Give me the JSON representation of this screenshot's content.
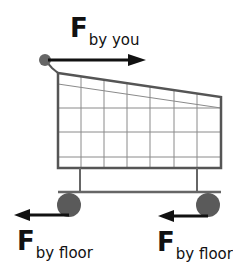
{
  "diagram": {
    "title": "",
    "colors": {
      "arrow": "#111111",
      "frame": "#555555",
      "grid": "#7a7a7a",
      "wheel": "#5a5a5a",
      "background": "#ffffff"
    },
    "labels": {
      "push": {
        "symbol": "F",
        "subscript": "by you"
      },
      "floor_left": {
        "symbol": "F",
        "subscript": "by floor"
      },
      "floor_right": {
        "symbol": "F",
        "subscript": "by floor"
      }
    },
    "arrows": [
      {
        "name": "force-by-you",
        "direction": "right"
      },
      {
        "name": "force-by-floor-left-wheel",
        "direction": "left"
      },
      {
        "name": "force-by-floor-right-wheel",
        "direction": "left"
      }
    ]
  }
}
